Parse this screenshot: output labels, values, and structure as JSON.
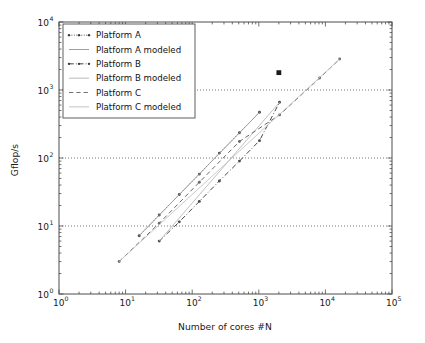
{
  "figure": {
    "background": "#ffffff",
    "frame_color": "#4d4d4d"
  },
  "chart_data": {
    "type": "line",
    "title": "",
    "subtitle": "",
    "xlabel": "Number of cores #N",
    "ylabel": "Gflop/s",
    "xscale": "log",
    "yscale": "log",
    "xlim": [
      1,
      100000
    ],
    "ylim": [
      1,
      10000
    ],
    "xticks": [
      1,
      10,
      100,
      1000,
      10000,
      100000
    ],
    "xticklabels": [
      "10^0",
      "10^1",
      "10^2",
      "10^3",
      "10^4",
      "10^5"
    ],
    "yticks": [
      1,
      10,
      100,
      1000,
      10000
    ],
    "yticklabels": [
      "10^0",
      "10^1",
      "10^2",
      "10^3",
      "10^4"
    ],
    "grid": {
      "horizontal": true,
      "vertical": false,
      "style": "dotted",
      "color": "#555555",
      "levels": [
        10,
        100,
        1000
      ]
    },
    "legend": {
      "position": "upper-left",
      "frame": true,
      "entries": [
        {
          "label": "Platform A",
          "style": "dotted",
          "color": "#3a3a3a",
          "marker": "dot"
        },
        {
          "label": "Platform A modeled",
          "style": "solid",
          "color": "#9a9a9a",
          "marker": "none"
        },
        {
          "label": "Platform B",
          "style": "dashdot",
          "color": "#3a3a3a",
          "marker": "dot"
        },
        {
          "label": "Platform B modeled",
          "style": "solid",
          "color": "#b5b5b5",
          "marker": "none"
        },
        {
          "label": "Platform C",
          "style": "dashed",
          "color": "#6a6a6a",
          "marker": "none"
        },
        {
          "label": "Platform C modeled",
          "style": "solid",
          "color": "#c0c0c0",
          "marker": "none"
        }
      ]
    },
    "series": [
      {
        "name": "Platform A",
        "style": "dotted",
        "color": "#4a4a4a",
        "marker": "dot",
        "points": [
          {
            "x": 16,
            "y": 7.2
          },
          {
            "x": 32,
            "y": 14.5
          },
          {
            "x": 64,
            "y": 29
          },
          {
            "x": 128,
            "y": 58
          },
          {
            "x": 256,
            "y": 118
          },
          {
            "x": 512,
            "y": 235
          },
          {
            "x": 1024,
            "y": 470
          }
        ]
      },
      {
        "name": "Platform A modeled",
        "style": "solid",
        "color": "#9a9a9a",
        "marker": "none",
        "points": [
          {
            "x": 16,
            "y": 7.2
          },
          {
            "x": 1024,
            "y": 470
          }
        ]
      },
      {
        "name": "Platform B",
        "style": "dashdot",
        "color": "#4a4a4a",
        "marker": "dot",
        "points": [
          {
            "x": 32,
            "y": 6.0
          },
          {
            "x": 64,
            "y": 11.5
          },
          {
            "x": 128,
            "y": 23
          },
          {
            "x": 256,
            "y": 46
          },
          {
            "x": 512,
            "y": 90
          },
          {
            "x": 1024,
            "y": 180
          },
          {
            "x": 2048,
            "y": 660
          }
        ]
      },
      {
        "name": "Platform B modeled",
        "style": "solid",
        "color": "#b5b5b5",
        "marker": "none",
        "points": [
          {
            "x": 32,
            "y": 6.0
          },
          {
            "x": 2048,
            "y": 660
          }
        ]
      },
      {
        "name": "Platform C",
        "style": "dashed",
        "color": "#6a6a6a",
        "marker": "dot",
        "points": [
          {
            "x": 8,
            "y": 3.0
          },
          {
            "x": 32,
            "y": 11
          },
          {
            "x": 128,
            "y": 44
          },
          {
            "x": 512,
            "y": 175
          },
          {
            "x": 2048,
            "y": 430
          },
          {
            "x": 8192,
            "y": 1500
          },
          {
            "x": 16384,
            "y": 2850
          }
        ]
      },
      {
        "name": "Platform C modeled",
        "style": "solid",
        "color": "#c0c0c0",
        "marker": "none",
        "points": [
          {
            "x": 8,
            "y": 3.0
          },
          {
            "x": 16384,
            "y": 2850
          }
        ]
      }
    ],
    "annotations": [
      {
        "name": "isolated-marker",
        "x": 2000,
        "y": 1800,
        "marker": "square",
        "color": "#1a1a1a"
      }
    ]
  }
}
